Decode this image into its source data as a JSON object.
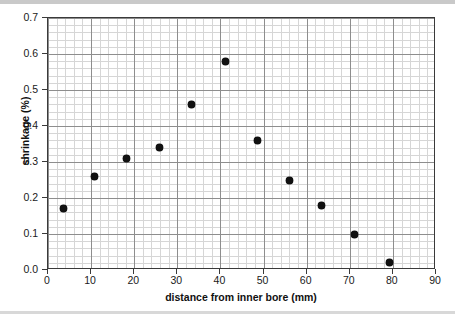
{
  "chart_data": {
    "type": "scatter",
    "title": "",
    "xlabel": "distance from inner bore (mm)",
    "ylabel": "shrinkage (%)",
    "xlim": [
      0,
      90
    ],
    "ylim": [
      0.0,
      0.7
    ],
    "xticks": [
      "0",
      "10",
      "20",
      "30",
      "40",
      "50",
      "60",
      "70",
      "80",
      "90"
    ],
    "xtick_values": [
      0,
      10,
      20,
      30,
      40,
      50,
      60,
      70,
      80,
      90
    ],
    "yticks": [
      "0.0",
      "0.1",
      "0.2",
      "0.3",
      "0.4",
      "0.5",
      "0.6",
      "0.7"
    ],
    "ytick_values": [
      0.0,
      0.1,
      0.2,
      0.3,
      0.4,
      0.5,
      0.6,
      0.7
    ],
    "x_minor_step": 2,
    "y_minor_step": 0.02,
    "grid": true,
    "legend": false,
    "marker_color": "#111111",
    "grid_color": "#d6d6d6",
    "grid_major_color": "#8e8e8e",
    "axis_color": "#3a3a3a",
    "series": [
      {
        "name": "shrinkage",
        "x": [
          3.5,
          10.9,
          18.3,
          25.8,
          33.4,
          41.1,
          48.7,
          56.1,
          63.5,
          71.2,
          79.1
        ],
        "y": [
          0.17,
          0.26,
          0.31,
          0.34,
          0.46,
          0.58,
          0.36,
          0.25,
          0.18,
          0.1,
          0.02
        ]
      }
    ]
  }
}
